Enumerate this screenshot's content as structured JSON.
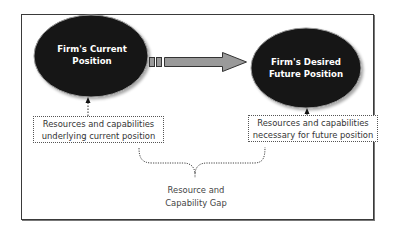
{
  "diagram": {
    "current_position": {
      "line1": "Firm's Current",
      "line2": "Position"
    },
    "future_position": {
      "line1": "Firm's Desired",
      "line2": "Future Position"
    },
    "current_resources": {
      "line1": "Resources and capabilities",
      "line2": "underlying current position"
    },
    "future_resources": {
      "line1": "Resources and capabilities",
      "line2": "necessary for future position"
    },
    "gap": {
      "line1": "Resource and",
      "line2": "Capability Gap"
    },
    "colors": {
      "ellipse": "#121212",
      "arrow": "#9a9a9a",
      "frame": "#3a3a3a",
      "text": "#333333"
    }
  }
}
